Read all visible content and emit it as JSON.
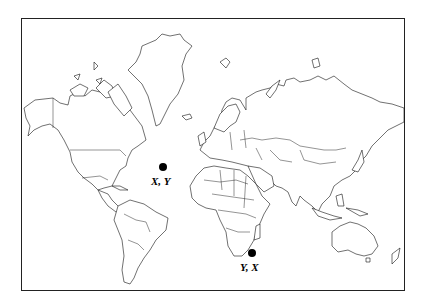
{
  "map": {
    "type": "world-political-outline",
    "projection": "mercator",
    "colors": {
      "stroke": "#111111",
      "land": "#ffffff",
      "marker": "#000000",
      "frame": "#222222"
    },
    "points": [
      {
        "id": "point-1",
        "label": "X, Y",
        "location": "North Atlantic Ocean",
        "x": 163,
        "y": 167
      },
      {
        "id": "point-2",
        "label": "Y, X",
        "location": "Southern Indian Ocean (south of Madagascar)",
        "x": 252,
        "y": 253
      }
    ]
  }
}
